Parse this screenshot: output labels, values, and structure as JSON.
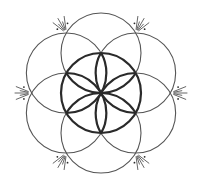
{
  "figure": {
    "width": 200,
    "height": 188,
    "center": [
      101,
      93
    ],
    "radius": 40,
    "background": "#ffffff",
    "stroke_color": "#2a2a2a",
    "thin_stroke_color": "#555555",
    "thick_stroke_width": 2.2,
    "thin_stroke_width": 1.1,
    "outer_circle_angles_deg": [
      90,
      30,
      -30,
      -90,
      -150,
      150
    ],
    "ray_groups": {
      "angles_deg": [
        0,
        60,
        120,
        180,
        240,
        300
      ],
      "distance": 69,
      "ray_count": 5,
      "ray_spread_deg": 44,
      "ray_inner_offset": 4,
      "ray_long": 13,
      "ray_short": 8,
      "dot_radius": 0.9,
      "dot_offset": 10
    }
  }
}
